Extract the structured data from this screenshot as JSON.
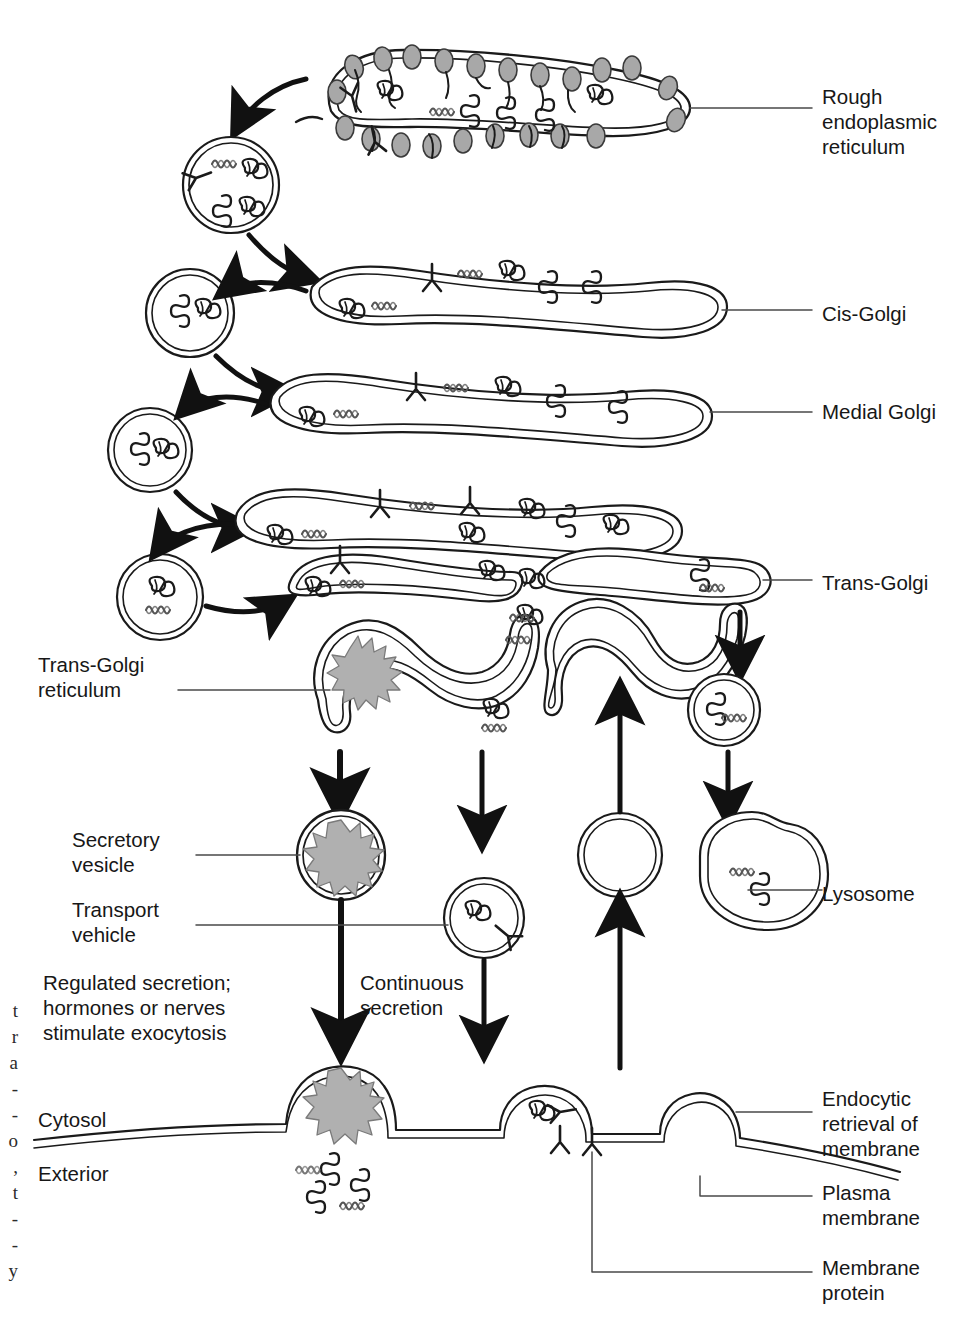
{
  "figure": {
    "background": "#ffffff",
    "ink": "#1a1a1a",
    "ribosome_fill": "#a8a8a8",
    "granule_fill": "#b0b0b0"
  },
  "labels_right": [
    {
      "id": "rough-er",
      "text": "Rough\nendoplasmic\nreticulum",
      "x": 822,
      "y": 84
    },
    {
      "id": "cis-golgi",
      "text": "Cis-Golgi",
      "x": 822,
      "y": 301
    },
    {
      "id": "medial-golgi",
      "text": "Medial Golgi",
      "x": 822,
      "y": 399
    },
    {
      "id": "trans-golgi",
      "text": "Trans-Golgi",
      "x": 822,
      "y": 570
    },
    {
      "id": "lysosome",
      "text": "Lysosome",
      "x": 822,
      "y": 881
    },
    {
      "id": "endocytic-retrieval",
      "text": "Endocytic\nretrieval of\nmembrane",
      "x": 822,
      "y": 1086
    },
    {
      "id": "plasma-membrane",
      "text": "Plasma\nmembrane",
      "x": 822,
      "y": 1180
    },
    {
      "id": "membrane-protein",
      "text": "Membrane\nprotein",
      "x": 822,
      "y": 1255
    }
  ],
  "labels_left": [
    {
      "id": "trans-golgi-reticulum",
      "text": "Trans-Golgi\nreticulum",
      "x": 38,
      "y": 652
    },
    {
      "id": "secretory-vesicle",
      "text": "Secretory\nvesicle",
      "x": 72,
      "y": 827
    },
    {
      "id": "transport-vehicle",
      "text": "Transport\nvehicle",
      "x": 72,
      "y": 897
    },
    {
      "id": "regulated-secretion",
      "text": "Regulated secretion;\nhormones or nerves\nstimulate exocytosis",
      "x": 43,
      "y": 970
    },
    {
      "id": "cytosol",
      "text": "Cytosol",
      "x": 38,
      "y": 1107
    },
    {
      "id": "exterior",
      "text": "Exterior",
      "x": 38,
      "y": 1161
    }
  ],
  "labels_center": [
    {
      "id": "continuous-secretion",
      "text": "Continuous\nsecretion",
      "x": 360,
      "y": 970
    }
  ],
  "edge_fragments": {
    "note": "Partial serif characters from the facing page, clipped at the left margin",
    "lines": [
      "t",
      "r",
      "a",
      "-",
      "-",
      "o",
      ",",
      "t",
      "-",
      "-",
      "y"
    ],
    "x": 2,
    "y_start": 998,
    "line_height": 26
  },
  "organelles": [
    {
      "id": "rough-er",
      "name": "rough endoplasmic reticulum",
      "ribosomes": 22
    },
    {
      "id": "cis-golgi",
      "name": "cis-Golgi cisterna"
    },
    {
      "id": "medial-golgi",
      "name": "medial Golgi cisterna"
    },
    {
      "id": "medial-golgi-2",
      "name": "medial Golgi cisterna lower"
    },
    {
      "id": "trans-golgi",
      "name": "trans-Golgi cisterna"
    },
    {
      "id": "trans-golgi-reticulum",
      "name": "trans-Golgi reticulum"
    },
    {
      "id": "secretory-vesicle",
      "name": "secretory vesicle with condensed granule"
    },
    {
      "id": "transport-vehicle",
      "name": "transport vesicle"
    },
    {
      "id": "endocytic-vesicle",
      "name": "endocytic retrieval vesicle"
    },
    {
      "id": "lysosome",
      "name": "lysosome"
    },
    {
      "id": "plasma-membrane",
      "name": "plasma membrane"
    }
  ],
  "transport_vesicles": [
    {
      "id": "er-to-cis",
      "cx": 231,
      "cy": 185,
      "r": 48
    },
    {
      "id": "cis-recycle",
      "cx": 190,
      "cy": 313,
      "r": 44
    },
    {
      "id": "medial-recycle",
      "cx": 150,
      "cy": 450,
      "r": 42
    },
    {
      "id": "trans-recycle",
      "cx": 160,
      "cy": 597,
      "r": 43
    },
    {
      "id": "lysosome-carrier",
      "cx": 724,
      "cy": 710,
      "r": 36
    }
  ]
}
